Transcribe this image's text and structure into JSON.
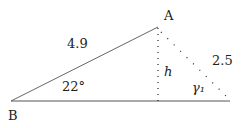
{
  "diagram": {
    "points": {
      "A": {
        "label": "A",
        "x": 158,
        "y": 27
      },
      "B": {
        "label": "B",
        "x": 11,
        "y": 101
      },
      "foot": {
        "x": 158,
        "y": 101
      },
      "C": {
        "x": 225,
        "y": 97
      }
    },
    "labels": {
      "side_AB": "4.9",
      "side_AC": "2.5",
      "angle_B": "22°",
      "height": "h",
      "angle_gamma": "γ₁",
      "vertex_A": "A",
      "vertex_B": "B"
    },
    "colors": {
      "line": "#444444",
      "text": "#222222"
    }
  }
}
